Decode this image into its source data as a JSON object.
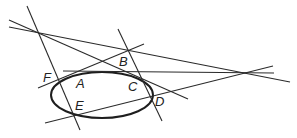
{
  "diagram": {
    "type": "geometry",
    "colors": {
      "stroke": "#2a2a2a",
      "background": "#ffffff"
    },
    "points": [
      {
        "label": "A",
        "x": 84,
        "y": 70
      },
      {
        "label": "B",
        "x": 128,
        "y": 50
      },
      {
        "label": "C",
        "x": 148,
        "y": 79
      },
      {
        "label": "D",
        "x": 150,
        "y": 97
      },
      {
        "label": "E",
        "x": 76,
        "y": 115
      },
      {
        "label": "F",
        "x": 57,
        "y": 79
      }
    ],
    "labels": {
      "A": "A",
      "B": "B",
      "C": "C",
      "D": "D",
      "E": "E",
      "F": "F"
    },
    "ellipse": {
      "cx": 102,
      "cy": 95,
      "rx": 52,
      "ry": 24
    }
  }
}
